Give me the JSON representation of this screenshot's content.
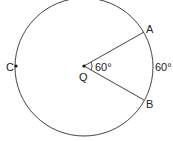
{
  "diagram": {
    "type": "circle-central-angle",
    "center": {
      "label": "Q"
    },
    "points": [
      {
        "label": "A"
      },
      {
        "label": "B"
      },
      {
        "label": "C"
      }
    ],
    "central_angle_label": "60°",
    "arc_label": "60°",
    "stroke_color": "#444444"
  }
}
